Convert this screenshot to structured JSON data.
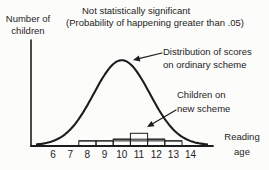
{
  "labels": {
    "y_axis": [
      "Number of",
      "children"
    ],
    "title": [
      "Not statistically significant",
      "(Probability of happening greater than .05)"
    ],
    "curve_annotation": [
      "Distribution of scores",
      "on ordinary scheme"
    ],
    "histogram_annotation": [
      "Children on",
      "new scheme"
    ],
    "x_axis": [
      "Reading",
      "age"
    ]
  },
  "colors": {
    "ink": "#1c1c1c",
    "background": "#fcfcfb"
  },
  "chart_data": {
    "type": "line",
    "title": "Not statistically significant (Probability of happening greater than .05)",
    "xlabel": "Reading age",
    "ylabel": "Number of children",
    "x_ticks": [
      6,
      7,
      8,
      9,
      10,
      11,
      12,
      13,
      14
    ],
    "y_ticks": [],
    "grid": false,
    "legend_position": "annotated-arrows",
    "series": [
      {
        "name": "Distribution of scores on ordinary scheme",
        "type": "normal-curve",
        "mean": 10,
        "sd": 1.63,
        "peak_relative_height": 1.0,
        "drawn_x_range": [
          5.1,
          15.0
        ]
      },
      {
        "name": "Children on new scheme",
        "type": "histogram",
        "bin_centers": [
          8,
          9,
          10,
          11,
          12,
          13
        ],
        "bin_width": 1,
        "relative_heights": [
          0.06,
          0.06,
          0.08,
          0.15,
          0.08,
          0.06
        ]
      }
    ]
  }
}
